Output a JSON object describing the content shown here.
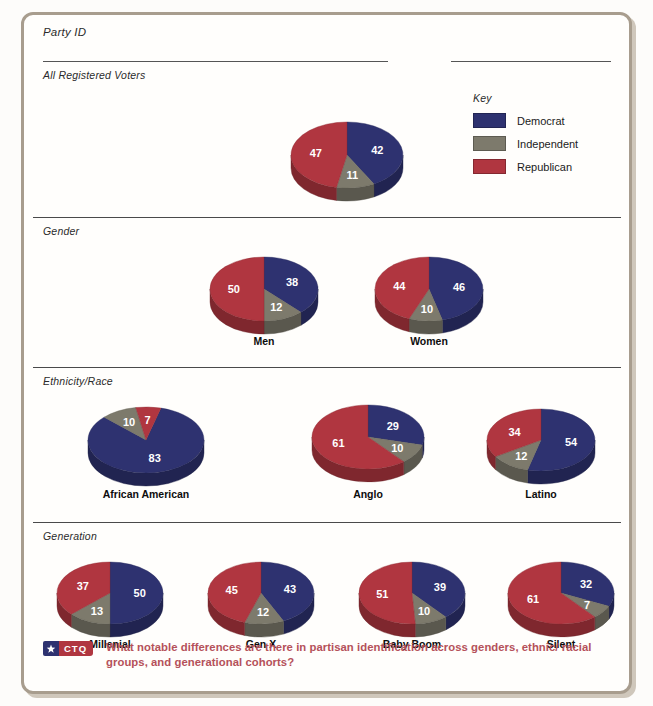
{
  "page": {
    "title": "Party ID",
    "background": "#fdfcfa",
    "frame_color": "#a89d8e"
  },
  "key": {
    "label": "Key",
    "items": [
      {
        "label": "Democrat",
        "color": "#2e3270"
      },
      {
        "label": "Independent",
        "color": "#7d7a6c"
      },
      {
        "label": "Republican",
        "color": "#b03640"
      }
    ]
  },
  "sections": [
    {
      "label": "All Registered Voters"
    },
    {
      "label": "Gender"
    },
    {
      "label": "Ethnicity/Race"
    },
    {
      "label": "Generation"
    }
  ],
  "footer": {
    "badge_tag": "CTQ",
    "badge_star": "star-icon",
    "question": "What notable differences are there in partisan identification across genders, ethnic/ racial groups, and generational cohorts?",
    "text_color": "#b5515a"
  },
  "chart_data": {
    "type": "pie",
    "title": "Party ID",
    "value_unit": "percent",
    "legend": [
      "Democrat",
      "Independent",
      "Republican"
    ],
    "legend_position": "top-right",
    "colors": {
      "Democrat": "#2e3270",
      "Independent": "#7d7a6c",
      "Republican": "#b03640"
    },
    "groups": [
      {
        "section": "All Registered Voters",
        "pies": [
          {
            "label": "",
            "values": {
              "Democrat": 42,
              "Independent": 11,
              "Republican": 47
            }
          }
        ]
      },
      {
        "section": "Gender",
        "pies": [
          {
            "label": "Men",
            "values": {
              "Democrat": 38,
              "Independent": 12,
              "Republican": 50
            }
          },
          {
            "label": "Women",
            "values": {
              "Democrat": 46,
              "Independent": 10,
              "Republican": 44
            }
          }
        ]
      },
      {
        "section": "Ethnicity/Race",
        "pies": [
          {
            "label": "African American",
            "values": {
              "Democrat": 83,
              "Independent": 10,
              "Republican": 7
            }
          },
          {
            "label": "Anglo",
            "values": {
              "Democrat": 29,
              "Independent": 10,
              "Republican": 61
            }
          },
          {
            "label": "Latino",
            "values": {
              "Democrat": 54,
              "Independent": 12,
              "Republican": 34
            }
          }
        ]
      },
      {
        "section": "Generation",
        "pies": [
          {
            "label": "Millenial",
            "values": {
              "Democrat": 50,
              "Independent": 13,
              "Republican": 37
            }
          },
          {
            "label": "Gen X",
            "values": {
              "Democrat": 43,
              "Independent": 12,
              "Republican": 45
            }
          },
          {
            "label": "Baby Boom",
            "values": {
              "Democrat": 39,
              "Independent": 10,
              "Republican": 51
            }
          },
          {
            "label": "Silent",
            "values": {
              "Democrat": 32,
              "Independent": 7,
              "Republican": 61
            }
          }
        ]
      }
    ]
  },
  "layout": {
    "pies": [
      {
        "group": 0,
        "index": 0,
        "cx": 326,
        "cy": 143,
        "rx": 56,
        "ry": 33,
        "depth": 13,
        "start": -90,
        "caption_y": 0,
        "caption_show": false
      },
      {
        "group": 1,
        "index": 0,
        "cx": 243,
        "cy": 277,
        "rx": 54,
        "ry": 32,
        "depth": 13,
        "start": -90,
        "caption_y": 323,
        "caption_show": true
      },
      {
        "group": 1,
        "index": 1,
        "cx": 408,
        "cy": 277,
        "rx": 54,
        "ry": 32,
        "depth": 13,
        "start": -90,
        "caption_y": 323,
        "caption_show": true
      },
      {
        "group": 2,
        "index": 0,
        "cx": 125,
        "cy": 428,
        "rx": 58,
        "ry": 33,
        "depth": 13,
        "start": -75,
        "caption_y": 476,
        "caption_show": true
      },
      {
        "group": 2,
        "index": 1,
        "cx": 347,
        "cy": 425,
        "rx": 56,
        "ry": 32,
        "depth": 13,
        "start": -90,
        "caption_y": 476,
        "caption_show": true
      },
      {
        "group": 2,
        "index": 2,
        "cx": 520,
        "cy": 428,
        "rx": 54,
        "ry": 31,
        "depth": 13,
        "start": -90,
        "caption_y": 476,
        "caption_show": true
      },
      {
        "group": 3,
        "index": 0,
        "cx": 89,
        "cy": 581,
        "rx": 53,
        "ry": 31,
        "depth": 13,
        "start": -90,
        "caption_y": 626,
        "caption_show": true
      },
      {
        "group": 3,
        "index": 1,
        "cx": 240,
        "cy": 581,
        "rx": 53,
        "ry": 31,
        "depth": 13,
        "start": -90,
        "caption_y": 626,
        "caption_show": true
      },
      {
        "group": 3,
        "index": 2,
        "cx": 391,
        "cy": 581,
        "rx": 53,
        "ry": 31,
        "depth": 13,
        "start": -90,
        "caption_y": 626,
        "caption_show": true
      },
      {
        "group": 3,
        "index": 3,
        "cx": 540,
        "cy": 581,
        "rx": 53,
        "ry": 31,
        "depth": 13,
        "start": -90,
        "caption_y": 626,
        "caption_show": true
      }
    ],
    "rules": [
      {
        "x": 22,
        "y": 49,
        "w": 345
      },
      {
        "x": 430,
        "y": 49,
        "w": 160
      },
      {
        "x": 12,
        "y": 205,
        "w": 588
      },
      {
        "x": 12,
        "y": 355,
        "w": 588
      },
      {
        "x": 12,
        "y": 510,
        "w": 588
      }
    ],
    "section_labels": [
      {
        "x": 22,
        "y": 57,
        "label_index": 0
      },
      {
        "x": 22,
        "y": 213,
        "label_index": 1
      },
      {
        "x": 22,
        "y": 363,
        "label_index": 2
      },
      {
        "x": 22,
        "y": 518,
        "label_index": 3
      }
    ]
  }
}
